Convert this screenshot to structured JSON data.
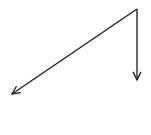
{
  "diagram": {
    "type": "vector-arrows",
    "stroke_color": "#1a1a1a",
    "background": "#ffffff",
    "origin": {
      "x": 137,
      "y": 9
    },
    "arrows": [
      {
        "name": "diagonal-arrow",
        "from": {
          "x": 137,
          "y": 9
        },
        "to": {
          "x": 12,
          "y": 94
        }
      },
      {
        "name": "vertical-arrow",
        "from": {
          "x": 137,
          "y": 9
        },
        "to": {
          "x": 137,
          "y": 80
        }
      }
    ]
  }
}
